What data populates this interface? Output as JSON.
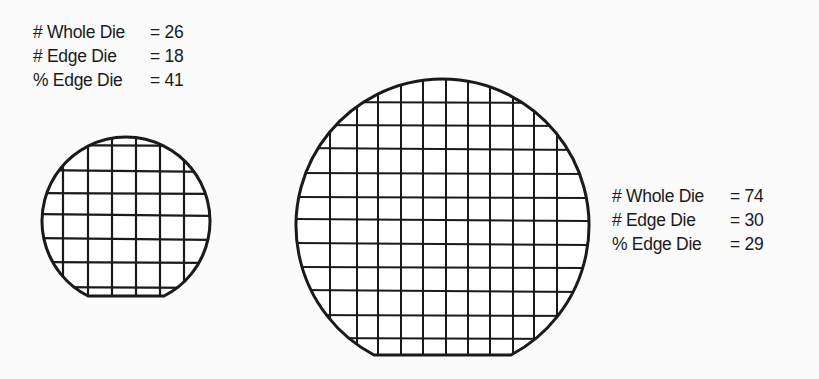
{
  "small_wafer": {
    "stats": [
      {
        "label": "# Whole Die",
        "value": "= 26"
      },
      {
        "label": "# Edge Die",
        "value": "= 18"
      },
      {
        "label": "% Edge Die",
        "value": "= 41"
      }
    ]
  },
  "large_wafer": {
    "stats": [
      {
        "label": "# Whole Die",
        "value": "= 74"
      },
      {
        "label": "# Edge Die",
        "value": "= 30"
      },
      {
        "label": "% Edge Die",
        "value": "= 29"
      }
    ]
  },
  "colors": {
    "background": "#fbfbfb",
    "ink": "#1a1a1a"
  }
}
